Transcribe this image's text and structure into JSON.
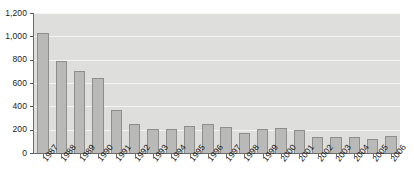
{
  "chart_data": {
    "type": "bar",
    "title": "",
    "subtitle": "",
    "xlabel": "",
    "ylabel": "",
    "categories": [
      "1987",
      "1988",
      "1989",
      "1990",
      "1991",
      "1992",
      "1993",
      "1994",
      "1995",
      "1996",
      "1997",
      "1998",
      "1999",
      "2000",
      "2001",
      "2002",
      "2003",
      "2004",
      "2005",
      "2006"
    ],
    "values": [
      1030,
      790,
      700,
      640,
      365,
      250,
      210,
      205,
      230,
      250,
      225,
      170,
      205,
      215,
      195,
      140,
      135,
      140,
      120,
      150
    ],
    "series": [
      {
        "name": "",
        "values": [
          1030,
          790,
          700,
          640,
          365,
          250,
          210,
          205,
          230,
          250,
          225,
          170,
          205,
          215,
          195,
          140,
          135,
          140,
          120,
          150
        ]
      }
    ],
    "ylim": [
      0,
      1200
    ],
    "ytick_values": [
      0,
      200,
      400,
      600,
      800,
      1000,
      1200
    ],
    "ytick_labels": [
      "0",
      "200",
      "400",
      "600",
      "800",
      "1,000",
      "1,200"
    ],
    "grid": true,
    "grid_orientation": "horizontal",
    "legend": false,
    "legend_position": "none",
    "annotations": [],
    "colors": {
      "bar_fill": "#b9b9b8",
      "bar_stroke": "#8e8e8d",
      "plot_background": "#dededd",
      "gridline": "#f4f4f3",
      "axis_line": "#6b6b6b",
      "tick_text": "#1a1a1a",
      "page_background": "#ffffff"
    },
    "xtick_label_rotation_deg": -52
  }
}
